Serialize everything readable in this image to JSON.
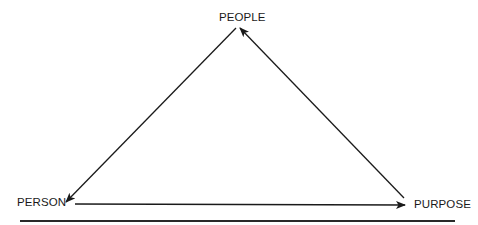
{
  "diagram": {
    "type": "triangle-cycle",
    "nodes": {
      "top": {
        "label": "PEOPLE"
      },
      "bottom_left": {
        "label": "PERSON"
      },
      "bottom_right": {
        "label": "PURPOSE"
      }
    },
    "edges": [
      {
        "from": "PEOPLE",
        "to": "PERSON",
        "direction": "arrow-to-person"
      },
      {
        "from": "PERSON",
        "to": "PURPOSE",
        "direction": "arrow-to-purpose"
      },
      {
        "from": "PURPOSE",
        "to": "PEOPLE",
        "direction": "arrow-to-people"
      }
    ],
    "colors": {
      "line": "#1a1a1a",
      "text": "#1a1a1a",
      "background": "#ffffff"
    }
  }
}
